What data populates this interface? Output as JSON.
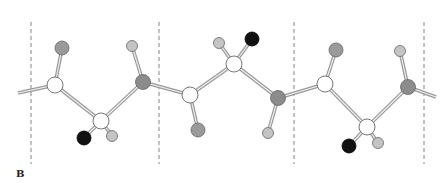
{
  "figure": {
    "panel_label": "B",
    "colors": {
      "carbon": "#ffffff",
      "nitrogen": "#8c8c8c",
      "oxygen": "#9a9a9a",
      "hydrogen": "#c4c4c4",
      "side_chain": "#111111",
      "bond": "#9a9a9a",
      "divider": "#777777"
    },
    "dividers": [
      31,
      159,
      294,
      424
    ],
    "atoms": [
      {
        "id": "C1",
        "type": "carbon",
        "x": 55,
        "y": 85,
        "r": 8
      },
      {
        "id": "O1",
        "type": "oxygen",
        "x": 62,
        "y": 48,
        "r": 7
      },
      {
        "id": "CA1",
        "type": "carbon",
        "x": 101,
        "y": 121,
        "r": 8
      },
      {
        "id": "R1",
        "type": "side_chain",
        "x": 84,
        "y": 138,
        "r": 7
      },
      {
        "id": "HA1",
        "type": "hydrogen",
        "x": 112,
        "y": 136,
        "r": 5.5
      },
      {
        "id": "N2",
        "type": "nitrogen",
        "x": 143,
        "y": 82,
        "r": 7.5
      },
      {
        "id": "HN2",
        "type": "hydrogen",
        "x": 132,
        "y": 46,
        "r": 5.5
      },
      {
        "id": "C2",
        "type": "carbon",
        "x": 190,
        "y": 95,
        "r": 8
      },
      {
        "id": "O2",
        "type": "oxygen",
        "x": 198,
        "y": 130,
        "r": 7
      },
      {
        "id": "CA2",
        "type": "carbon",
        "x": 234,
        "y": 64,
        "r": 8
      },
      {
        "id": "HA2",
        "type": "hydrogen",
        "x": 219,
        "y": 43,
        "r": 5.5
      },
      {
        "id": "R2",
        "type": "side_chain",
        "x": 252,
        "y": 39,
        "r": 7
      },
      {
        "id": "N3",
        "type": "nitrogen",
        "x": 278,
        "y": 98,
        "r": 7.5
      },
      {
        "id": "HN3",
        "type": "hydrogen",
        "x": 268,
        "y": 133,
        "r": 5.5
      },
      {
        "id": "C3",
        "type": "carbon",
        "x": 325,
        "y": 84,
        "r": 8
      },
      {
        "id": "O3",
        "type": "oxygen",
        "x": 336,
        "y": 50,
        "r": 7
      },
      {
        "id": "CA3",
        "type": "carbon",
        "x": 367,
        "y": 127,
        "r": 8
      },
      {
        "id": "R3",
        "type": "side_chain",
        "x": 349,
        "y": 146,
        "r": 7
      },
      {
        "id": "HA3",
        "type": "hydrogen",
        "x": 378,
        "y": 143,
        "r": 5.5
      },
      {
        "id": "N4",
        "type": "nitrogen",
        "x": 408,
        "y": 87,
        "r": 7.5
      },
      {
        "id": "HN4",
        "type": "hydrogen",
        "x": 400,
        "y": 51,
        "r": 5.5
      }
    ],
    "bonds": [
      {
        "from": [
          18,
          93
        ],
        "to": [
          55,
          85
        ],
        "double": true
      },
      {
        "from": "C1",
        "to": "O1",
        "double": true
      },
      {
        "from": "C1",
        "to": "CA1",
        "double": true
      },
      {
        "from": "CA1",
        "to": "R1",
        "double": true
      },
      {
        "from": "CA1",
        "to": "HA1",
        "double": true
      },
      {
        "from": "CA1",
        "to": "N2",
        "double": true
      },
      {
        "from": "N2",
        "to": "HN2",
        "double": true
      },
      {
        "from": "N2",
        "to": "C2",
        "double": true
      },
      {
        "from": "C2",
        "to": "O2",
        "double": true
      },
      {
        "from": "C2",
        "to": "CA2",
        "double": true
      },
      {
        "from": "CA2",
        "to": "HA2",
        "double": true
      },
      {
        "from": "CA2",
        "to": "R2",
        "double": true
      },
      {
        "from": "CA2",
        "to": "N3",
        "double": true
      },
      {
        "from": "N3",
        "to": "HN3",
        "double": true
      },
      {
        "from": "N3",
        "to": "C3",
        "double": true
      },
      {
        "from": "C3",
        "to": "O3",
        "double": true
      },
      {
        "from": "C3",
        "to": "CA3",
        "double": true
      },
      {
        "from": "CA3",
        "to": "R3",
        "double": true
      },
      {
        "from": "CA3",
        "to": "HA3",
        "double": true
      },
      {
        "from": "CA3",
        "to": "N4",
        "double": true
      },
      {
        "from": "N4",
        "to": "HN4",
        "double": true
      },
      {
        "from": [
          408,
          87
        ],
        "to": [
          436,
          97
        ],
        "double": true
      }
    ]
  }
}
